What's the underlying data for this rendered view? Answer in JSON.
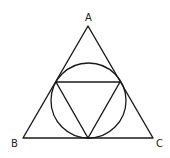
{
  "diagram": {
    "type": "geometry",
    "colors": {
      "stroke": "#1a1a1a",
      "background": "#ffffff",
      "label": "#222222"
    },
    "labels": {
      "A": "A",
      "B": "B",
      "C": "C"
    },
    "outer_triangle": {
      "A": [
        88,
        26
      ],
      "B": [
        23,
        138
      ],
      "C": [
        153,
        138
      ]
    },
    "incircle": {
      "cx": 88.5,
      "cy": 100.5,
      "r": 37.5
    },
    "inner_triangle": {
      "p1": [
        56,
        82
      ],
      "p2": [
        120,
        82
      ],
      "p3": [
        88,
        138
      ]
    }
  }
}
